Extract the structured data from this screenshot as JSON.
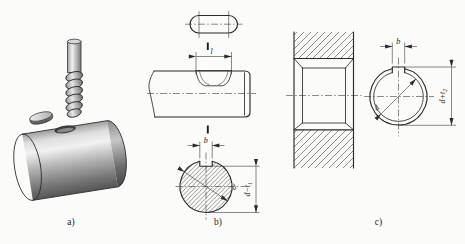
{
  "figure_title": "keyway-milling-technical-figure",
  "panels": {
    "a": {
      "label": "a)",
      "depicts": "3d-shaft-with-end-mill-and-key"
    },
    "b": {
      "label": "b)",
      "dim_length": "l",
      "dim_width": "b",
      "dim_diameter": "d",
      "dim_depth_base": "d−t",
      "dim_depth_sub": "1",
      "depicts": "shaft-keyway-views"
    },
    "c": {
      "label": "c)",
      "dim_width": "b",
      "dim_diameter": "d",
      "dim_depth_base": "d+t",
      "dim_depth_sub": "2",
      "depicts": "hub-keyway-views"
    }
  },
  "colors": {
    "ink": "#2b2b2b",
    "paper": "#fbfbf9",
    "metal_light": "#f1f1f1",
    "metal_mid": "#a8a8a8",
    "metal_dark": "#575757"
  }
}
